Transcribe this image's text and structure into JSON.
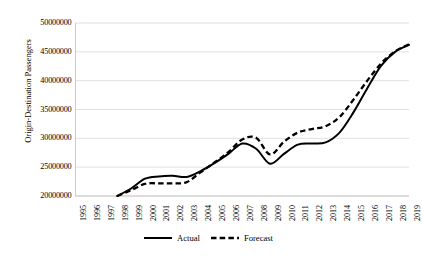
{
  "chart_data": {
    "type": "line",
    "title": "",
    "xlabel": "",
    "ylabel": "Origin-Destination Passengers",
    "x": [
      1995,
      1996,
      1997,
      1998,
      1999,
      2000,
      2001,
      2002,
      2003,
      2004,
      2005,
      2006,
      2007,
      2008,
      2009,
      2010,
      2011,
      2012,
      2013,
      2014,
      2015,
      2016,
      2017,
      2018,
      2019
    ],
    "xlim": [
      1995,
      2019
    ],
    "ylim": [
      20000000,
      50000000
    ],
    "yticks": [
      20000000,
      25000000,
      30000000,
      35000000,
      40000000,
      45000000,
      50000000
    ],
    "ytick_labels": [
      "20000000",
      "25000000",
      "30000000",
      "35000000",
      "40000000",
      "45000000",
      "50000000"
    ],
    "xtick_labels": [
      "1995",
      "1996",
      "1997",
      "1998",
      "1999",
      "2000",
      "2001",
      "2002",
      "2003",
      "2004",
      "2005",
      "2006",
      "2007",
      "2008",
      "2009",
      "2010",
      "2011",
      "2012",
      "2013",
      "2014",
      "2015",
      "2016",
      "2017",
      "2018",
      "2019"
    ],
    "grid": "horizontal",
    "legend_position": "bottom",
    "series": [
      {
        "name": "Actual",
        "style": "solid",
        "color": "#000000",
        "x": [
          1998,
          1999,
          2000,
          2001,
          2002,
          2003,
          2004,
          2005,
          2006,
          2007,
          2008,
          2009,
          2010,
          2011,
          2012,
          2013,
          2014,
          2015,
          2016,
          2017,
          2018,
          2019
        ],
        "values": [
          20000000,
          21300000,
          23000000,
          23400000,
          23500000,
          23300000,
          24300000,
          25700000,
          27300000,
          29100000,
          28200000,
          25600000,
          27300000,
          28900000,
          29100000,
          29300000,
          31000000,
          34500000,
          38700000,
          42600000,
          45000000,
          46200000
        ]
      },
      {
        "name": "Forecast",
        "style": "dashed",
        "color": "#000000",
        "x": [
          1998,
          1999,
          2000,
          2001,
          2002,
          2003,
          2004,
          2005,
          2006,
          2007,
          2008,
          2009,
          2010,
          2011,
          2012,
          2013,
          2014,
          2015,
          2016,
          2017,
          2018,
          2019
        ],
        "values": [
          20000000,
          21000000,
          22100000,
          22200000,
          22200000,
          22400000,
          24100000,
          25800000,
          27600000,
          29800000,
          30100000,
          27200000,
          29400000,
          31000000,
          31600000,
          32100000,
          33700000,
          36700000,
          40000000,
          43000000,
          45100000,
          46300000
        ]
      }
    ]
  },
  "legend": {
    "items": [
      {
        "label": "Actual",
        "style": "solid"
      },
      {
        "label": "Forecast",
        "style": "dashed"
      }
    ]
  }
}
